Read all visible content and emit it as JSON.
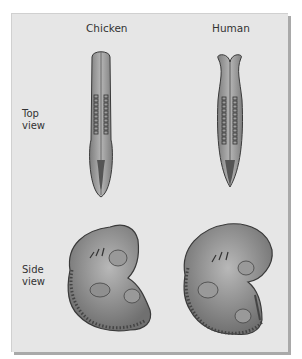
{
  "figure": {
    "columns": [
      {
        "label": "Chicken"
      },
      {
        "label": "Human"
      }
    ],
    "rows": [
      {
        "label_line1": "Top",
        "label_line2": "view"
      },
      {
        "label_line1": "Side",
        "label_line2": "view"
      }
    ],
    "colors": {
      "panel_bg": "#e6e6e6",
      "panel_shadow": "#a9a9a9",
      "embryo_fill": "#9a9a9a",
      "embryo_outline": "#3a3a3a"
    }
  }
}
